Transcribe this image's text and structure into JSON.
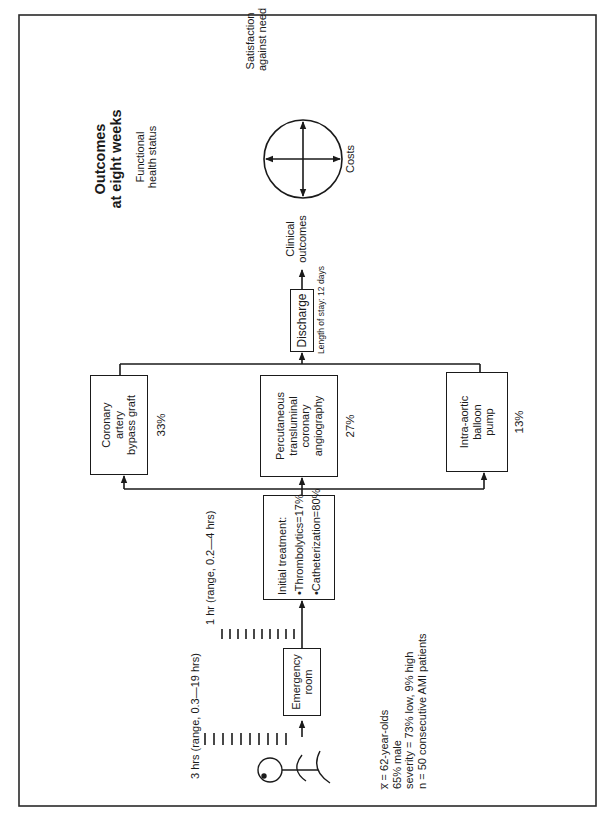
{
  "title": {
    "line1": "Outcomes",
    "line2": "at eight weeks"
  },
  "patient": {
    "icon": "stick-figure-patient-icon"
  },
  "timeline": {
    "arrival_to_er": "3 hrs (range, 0.3—19 hrs)",
    "er_to_treatment": "1 hr (range, 0.2—4 hrs)"
  },
  "emergency_room": {
    "line1": "Emergency",
    "line2": "room"
  },
  "initial_treatment": {
    "heading": "Initial treatment:",
    "items": [
      "•Thrombolytics=17%",
      "•Catheterization=80%"
    ]
  },
  "procedures": [
    {
      "lines": [
        "Coronary",
        "artery",
        "bypass graft"
      ],
      "percent": "33%"
    },
    {
      "lines": [
        "Percutaneous",
        "transluminal",
        "coronary",
        "angiography"
      ],
      "percent": "27%"
    },
    {
      "lines": [
        "Intra-aortic",
        "balloon",
        "pump"
      ],
      "percent": "13%"
    }
  ],
  "discharge": {
    "label": "Discharge",
    "length_of_stay": "Length of stay: 12 days"
  },
  "outcomes": {
    "clinical": [
      "Clinical",
      "outcomes"
    ],
    "functional": [
      "Functional",
      "health status"
    ],
    "satisfaction": [
      "Satisfaction",
      "against need"
    ],
    "costs": "Costs",
    "compass_icon": "four-way-arrow-circle-icon"
  },
  "demographics": [
    "x̅ = 62-year-olds",
    "65% male",
    "severity = 73% low, 9% high",
    "n = 50 consecutive AMI patients"
  ],
  "colors": {
    "ink": "#1a1a1a",
    "paper": "#ffffff"
  }
}
